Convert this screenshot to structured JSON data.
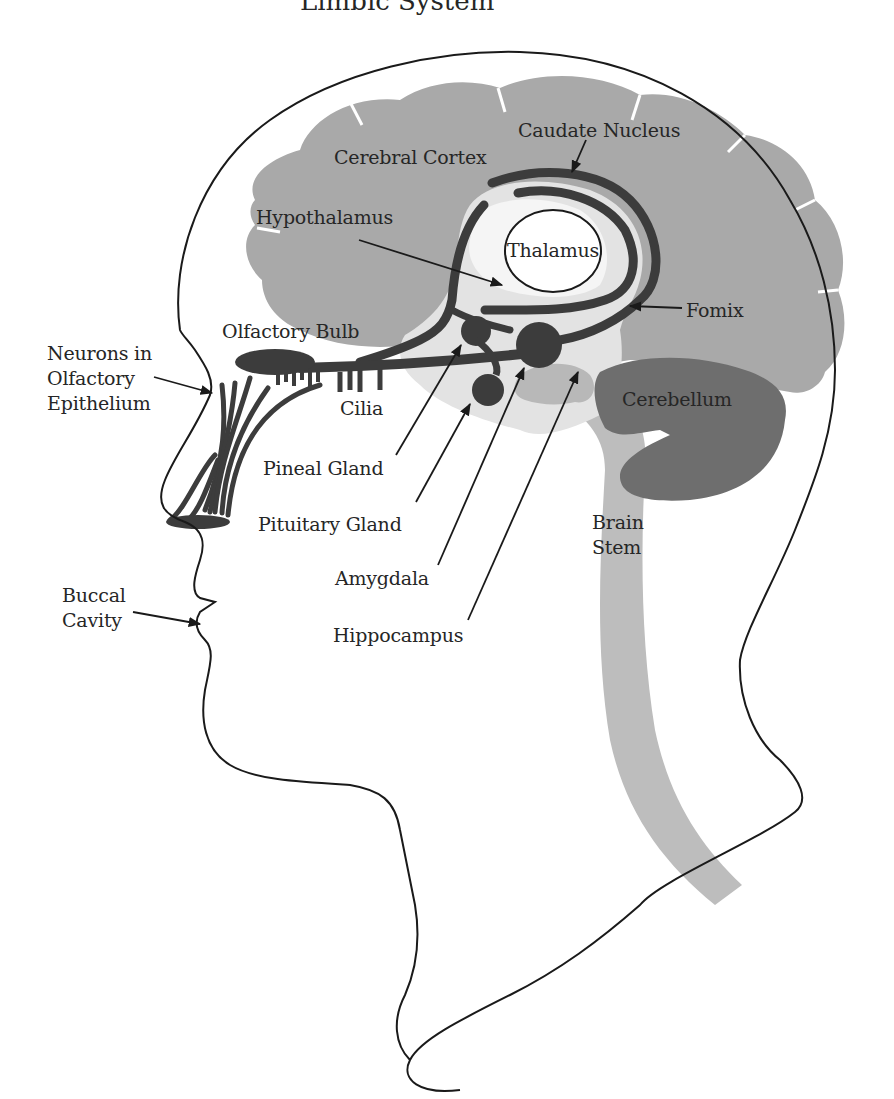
{
  "diagram": {
    "title_cropped": "Limbic System",
    "colors": {
      "outline": "#1a1a1a",
      "cortex": "#a9a9a9",
      "cerebellum": "#6e6e6e",
      "brain_stem": "#bdbdbd",
      "limbic_light": "#d9d9d9",
      "dark_structures": "#3c3c3c",
      "background": "#ffffff"
    },
    "labels": {
      "cerebral_cortex": "Cerebral Cortex",
      "caudate_nucleus": "Caudate Nucleus",
      "hypothalamus": "Hypothalamus",
      "thalamus": "Thalamus",
      "fornix": "Fomix",
      "olfactory_bulb": "Olfactory Bulb",
      "neurons_olfactory_epithelium": "Neurons in\nOlfactory\nEpithelium",
      "cilia": "Cilia",
      "cerebellum": "Cerebellum",
      "pineal_gland": "Pineal Gland",
      "pituitary_gland": "Pituitary Gland",
      "amygdala": "Amygdala",
      "hippocampus": "Hippocampus",
      "brain_stem": "Brain\nStem",
      "buccal_cavity": "Buccal\nCavity"
    }
  }
}
